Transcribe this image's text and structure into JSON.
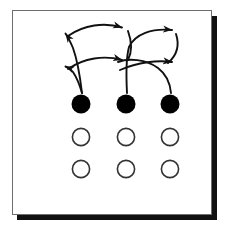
{
  "figure": {
    "background_color": "#ffffff",
    "frame": {
      "border_color": "#6e6e6e",
      "shadow_color": "#111111",
      "x": 12,
      "y": 10,
      "width": 200,
      "height": 205
    },
    "stroke_color": "#111111",
    "filled_color": "#000000",
    "open_fill_color": "#ffffff"
  },
  "grid": {
    "columns": [
      81,
      126,
      170
    ],
    "rows": [
      {
        "name": "row-filled",
        "y": 104,
        "style": "filled",
        "count": 3
      },
      {
        "name": "row-open-middle",
        "y": 137,
        "style": "open",
        "count": 3
      },
      {
        "name": "row-open-bottom",
        "y": 169,
        "style": "open",
        "count": 3
      }
    ],
    "radius": 9,
    "open_stroke_width": 1.6
  },
  "arrows": {
    "stroke_width": 1.9,
    "head_length": 9,
    "bands": [
      {
        "name": "upper-band",
        "y": 32
      },
      {
        "name": "lower-band",
        "y": 64
      }
    ],
    "items": [
      {
        "name": "arrow-upper-left",
        "direction": "left",
        "band": "upper",
        "from_dot": 0,
        "tip_x": 64,
        "tip_y": 32
      },
      {
        "name": "arrow-upper-middle",
        "direction": "right",
        "band": "upper",
        "from_dot": 0,
        "tip_x": 131,
        "tip_y": 30
      },
      {
        "name": "arrow-upper-right",
        "direction": "right",
        "band": "upper",
        "from_dot": 1,
        "tip_x": 181,
        "tip_y": 32
      },
      {
        "name": "arrow-lower-left",
        "direction": "left",
        "band": "lower",
        "from_dot": 0,
        "tip_x": 64,
        "tip_y": 66
      },
      {
        "name": "arrow-lower-middle",
        "direction": "right",
        "band": "lower",
        "from_dot": 1,
        "tip_x": 131,
        "tip_y": 62
      },
      {
        "name": "arrow-lower-right",
        "direction": "right",
        "band": "lower",
        "from_dot": 2,
        "tip_x": 181,
        "tip_y": 64
      }
    ]
  }
}
